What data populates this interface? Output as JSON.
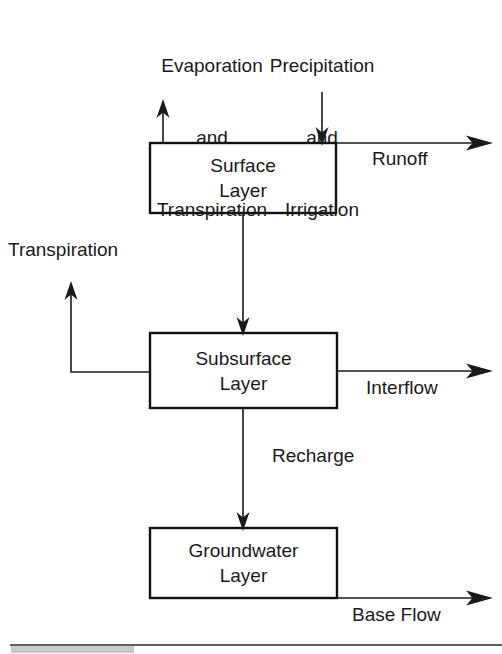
{
  "diagram": {
    "inputs": {
      "evaporation": {
        "line1": "Evaporation",
        "line2": "and",
        "line3": "Transpiration"
      },
      "precipitation": {
        "line1": "Precipitation",
        "line2": "and",
        "line3": "Irrigation"
      }
    },
    "boxes": [
      {
        "id": "surface",
        "line1": "Surface",
        "line2": "Layer"
      },
      {
        "id": "subsurface",
        "line1": "Subsurface",
        "line2": "Layer"
      },
      {
        "id": "groundwater",
        "line1": "Groundwater",
        "line2": "Layer"
      }
    ],
    "flows": {
      "runoff": "Runoff",
      "transpiration": "Transpiration",
      "interflow": "Interflow",
      "recharge": "Recharge",
      "base_flow": "Base Flow"
    },
    "colors": {
      "ink": "#1a1a1a",
      "box_stroke": "#111111",
      "background": "#ffffff",
      "rule": "#2b2b2b"
    }
  }
}
